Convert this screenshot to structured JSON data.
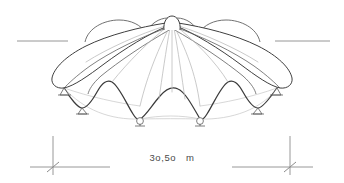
{
  "drawing": {
    "type": "architectural-elevation",
    "subject": "radial tensile membrane canopy / umbrella tent elevation",
    "background_color": "#ffffff",
    "canvas": {
      "width": 344,
      "height": 183
    }
  },
  "dimension": {
    "label": "3o,5o   m",
    "value_text": "3o,5o",
    "unit_text": "m",
    "span_start_x": 53,
    "span_end_x": 290,
    "baseline_y": 167,
    "extension_top_y": 136,
    "tick_style": "oblique-slash",
    "line_color": "#8c8c8c"
  },
  "ground_line": {
    "left": {
      "x1": 17,
      "x2": 68,
      "y": 41
    },
    "right": {
      "x1": 275,
      "x2": 330,
      "y": 41
    },
    "color": "#8a8a8a"
  },
  "canopy": {
    "apex": {
      "x": 172,
      "y": 21
    },
    "crown_radius": 7,
    "outline_color": "#4a4a4a",
    "ridge_color": "#b9b9b9",
    "ground_ellipse_color": "#c3c3c3",
    "ridges_count": 9,
    "scallops_count": 8,
    "left_extent_x": 52,
    "right_extent_x": 292,
    "lower_edge_y_peak": 84,
    "lower_edge_y_valley": 118
  },
  "anchors": {
    "count": 6,
    "color": "#5a5a5a",
    "points": [
      {
        "x": 64,
        "y": 88,
        "kind": "outer-foot-left"
      },
      {
        "x": 97,
        "y": 107,
        "kind": "foot"
      },
      {
        "x": 140,
        "y": 119,
        "kind": "foot-center-left"
      },
      {
        "x": 200,
        "y": 119,
        "kind": "foot-center-right"
      },
      {
        "x": 243,
        "y": 107,
        "kind": "foot"
      },
      {
        "x": 277,
        "y": 88,
        "kind": "outer-foot-right"
      }
    ]
  }
}
